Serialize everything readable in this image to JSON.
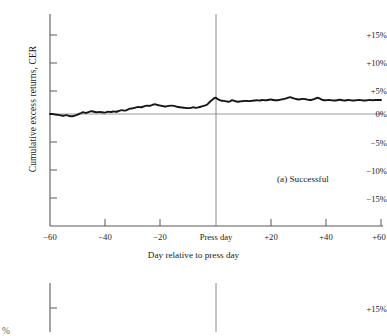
{
  "figure": {
    "background_color": "#ffffff",
    "line_color": "#161616",
    "axis_color": "#5a5a5a",
    "press_line_color": "#8a8a8a"
  },
  "panel_a": {
    "annotation": "(a)  Successful",
    "ylabel": "Cumulative excess returns, CER",
    "xlabel": "Day relative to press day",
    "ytick_labels": [
      "+15%",
      "+10%",
      "+5%",
      "0%",
      "−5%",
      "−10%",
      "−15%"
    ],
    "xtick_labels": [
      "−60",
      "−40",
      "−20",
      "Press day",
      "+20",
      "+40",
      "+60"
    ]
  },
  "panel_b": {
    "ytick_labels": [
      "+15%"
    ],
    "clipped_ylabel": "%"
  },
  "chart_data": {
    "type": "line",
    "title": "(a)  Successful",
    "xlabel": "Day relative to press day",
    "ylabel": "Cumulative excess returns, CER",
    "xlim": [
      -60,
      60
    ],
    "ylim": [
      -17.5,
      17.5
    ],
    "xticks": [
      -60,
      -40,
      -20,
      0,
      20,
      40,
      60
    ],
    "xticklabels": [
      "−60",
      "−40",
      "−20",
      "Press day",
      "+20",
      "+40",
      "+60"
    ],
    "yticks": [
      15,
      10,
      5,
      0,
      -5,
      -10,
      -15
    ],
    "yticklabels": [
      "+15%",
      "+10%",
      "+5%",
      "0%",
      "−5%",
      "−10%",
      "−15%"
    ],
    "grid": false,
    "legend": null,
    "reference_lines": [
      {
        "orientation": "horizontal",
        "value": 0,
        "style": "thin-gray"
      },
      {
        "orientation": "vertical",
        "value": 0,
        "label": "Press day",
        "style": "thin-gray"
      }
    ],
    "series": [
      {
        "name": "Successful",
        "x": [
          -60,
          -59,
          -58,
          -57,
          -56,
          -55,
          -54,
          -53,
          -52,
          -51,
          -50,
          -49,
          -48,
          -47,
          -46,
          -45,
          -44,
          -43,
          -42,
          -41,
          -40,
          -39,
          -38,
          -37,
          -36,
          -35,
          -34,
          -33,
          -32,
          -31,
          -30,
          -29,
          -28,
          -27,
          -26,
          -25,
          -24,
          -23,
          -22,
          -21,
          -20,
          -19,
          -18,
          -17,
          -16,
          -15,
          -14,
          -13,
          -12,
          -11,
          -10,
          -9,
          -8,
          -7,
          -6,
          -5,
          -4,
          -3,
          -2,
          -1,
          0,
          1,
          2,
          3,
          4,
          5,
          6,
          7,
          8,
          9,
          10,
          11,
          12,
          13,
          14,
          15,
          16,
          17,
          18,
          19,
          20,
          21,
          22,
          23,
          24,
          25,
          26,
          27,
          28,
          29,
          30,
          31,
          32,
          33,
          34,
          35,
          36,
          37,
          38,
          39,
          40,
          41,
          42,
          43,
          44,
          45,
          46,
          47,
          48,
          49,
          50,
          51,
          52,
          53,
          54,
          55,
          56,
          57,
          58,
          59,
          60
        ],
        "y": [
          0.0,
          0.0,
          -0.1,
          -0.15,
          -0.25,
          -0.3,
          -0.2,
          -0.35,
          -0.4,
          -0.3,
          -0.1,
          0.1,
          0.3,
          0.2,
          0.35,
          0.5,
          0.4,
          0.3,
          0.35,
          0.3,
          0.25,
          0.4,
          0.35,
          0.45,
          0.4,
          0.55,
          0.7,
          0.6,
          0.75,
          0.95,
          1.0,
          1.15,
          1.25,
          1.2,
          1.35,
          1.5,
          1.45,
          1.6,
          1.75,
          1.6,
          1.5,
          1.4,
          1.35,
          1.45,
          1.5,
          1.45,
          1.3,
          1.2,
          1.15,
          1.1,
          1.05,
          1.1,
          1.2,
          1.1,
          1.2,
          1.35,
          1.5,
          1.7,
          2.2,
          2.6,
          2.9,
          2.6,
          2.4,
          2.35,
          2.25,
          2.2,
          2.45,
          2.3,
          2.2,
          2.25,
          2.3,
          2.35,
          2.3,
          2.35,
          2.4,
          2.45,
          2.4,
          2.5,
          2.45,
          2.5,
          2.6,
          2.5,
          2.45,
          2.5,
          2.6,
          2.7,
          2.85,
          3.0,
          2.85,
          2.7,
          2.6,
          2.65,
          2.7,
          2.6,
          2.5,
          2.55,
          2.7,
          2.9,
          2.7,
          2.5,
          2.45,
          2.5,
          2.45,
          2.4,
          2.45,
          2.55,
          2.45,
          2.4,
          2.5,
          2.45,
          2.4,
          2.45,
          2.5,
          2.45,
          2.4,
          2.45,
          2.5,
          2.45,
          2.5,
          2.5,
          2.5
        ]
      }
    ]
  }
}
